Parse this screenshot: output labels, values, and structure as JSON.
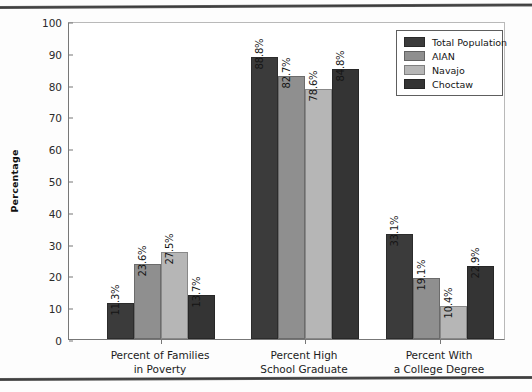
{
  "chart_data": {
    "type": "bar",
    "title": "",
    "xlabel": "",
    "ylabel": "Percentage",
    "ylim": [
      0,
      100
    ],
    "yticks": [
      0,
      10,
      20,
      30,
      40,
      50,
      60,
      70,
      80,
      90,
      100
    ],
    "grid": false,
    "legend_position": "top-right",
    "categories": [
      "Percent of Families\nin Poverty",
      "Percent High\nSchool Graduate",
      "Percent With\na College Degree"
    ],
    "category_lines": [
      [
        "Percent of Families",
        "in Poverty"
      ],
      [
        "Percent High",
        "School Graduate"
      ],
      [
        "Percent With",
        "a College Degree"
      ]
    ],
    "series": [
      {
        "name": "Total Population",
        "color": "#3b3b3b",
        "values": [
          11.3,
          88.8,
          33.1
        ],
        "labels": [
          "11.3%",
          "88.8%",
          "33.1%"
        ]
      },
      {
        "name": "AIAN",
        "color": "#8f8f8f",
        "values": [
          23.6,
          82.7,
          19.1
        ],
        "labels": [
          "23.6%",
          "82.7%",
          "19.1%"
        ]
      },
      {
        "name": "Navajo",
        "color": "#b6b6b6",
        "values": [
          27.5,
          78.6,
          10.4
        ],
        "labels": [
          "27.5%",
          "78.6%",
          "10.4%"
        ]
      },
      {
        "name": "Choctaw",
        "color": "#343434",
        "values": [
          13.7,
          84.8,
          22.9
        ],
        "labels": [
          "13.7%",
          "84.8%",
          "22.9%"
        ]
      }
    ]
  },
  "page": {
    "rule_color": "#3a3a3a",
    "background": "#fdfdfd"
  }
}
